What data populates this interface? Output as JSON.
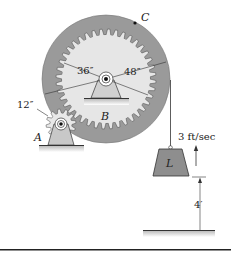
{
  "figure": {
    "labels": {
      "point_c": "C",
      "gear_a": "A",
      "gear_b": "B",
      "load": "L"
    },
    "dimensions": {
      "inner_radius": "36″",
      "outer_radius": "48″",
      "pinion_radius": "12″",
      "height": "4′"
    },
    "velocity": {
      "label": "3 ft/sec",
      "direction": "up"
    },
    "colors": {
      "ring": "#9a9a9a",
      "gear_face": "#e6e6e6",
      "support": "#c8c8c8",
      "load": "#8e8e8e",
      "line": "#222222"
    }
  }
}
